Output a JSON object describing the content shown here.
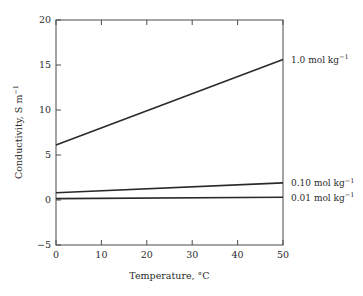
{
  "chart_data": {
    "type": "line",
    "title": "",
    "xlabel": "Temperature, °C",
    "ylabel": "Conductivity, S m⁻¹",
    "xlim": [
      0,
      50
    ],
    "ylim": [
      -5,
      20
    ],
    "xticks": [
      "0",
      "10",
      "20",
      "30",
      "40",
      "50"
    ],
    "xtick_values": [
      0,
      10,
      20,
      30,
      40,
      50
    ],
    "yticks": [
      "-5",
      "0",
      "5",
      "10",
      "15",
      "20"
    ],
    "ytick_values": [
      -5,
      0,
      5,
      10,
      15,
      20
    ],
    "grid": false,
    "legend_position": "right-of-axes-inline",
    "x": [
      0,
      50
    ],
    "series": [
      {
        "name": "1.0 mol kg⁻¹",
        "label_main": "1.0 mol kg",
        "label_sup": "−1",
        "values": [
          6.1,
          15.6
        ],
        "color": "#2a2a2a"
      },
      {
        "name": "0.10 mol kg⁻¹",
        "label_main": "0.10 mol kg",
        "label_sup": "−1",
        "values": [
          0.8,
          1.9
        ],
        "color": "#2a2a2a"
      },
      {
        "name": "0.01 mol kg⁻¹",
        "label_main": "0.01 mol kg",
        "label_sup": "−1",
        "values": [
          0.15,
          0.3
        ],
        "color": "#2a2a2a"
      }
    ],
    "ylabel_main": "Conductivity, S m",
    "ylabel_sup": "−1",
    "axis_color": "#4a4a4a",
    "background": "#ffffff"
  }
}
